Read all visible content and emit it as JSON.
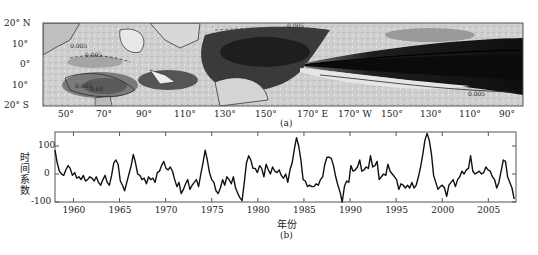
{
  "chart_data": [
    {
      "panel": "(a)",
      "type": "heatmap",
      "title": "",
      "description": "Spatial pattern map (EOF mode) over tropical Indian-Pacific Ocean, grayscale shaded with contours",
      "xlabel": "",
      "ylabel": "",
      "x_ticks": [
        "50°",
        "70°",
        "90°",
        "110°",
        "130°",
        "150°",
        "170° E",
        "170° W",
        "150°",
        "130°",
        "110°",
        "90°"
      ],
      "y_ticks": [
        "20° N",
        "10°",
        "0°",
        "10°",
        "20° S"
      ],
      "contour_labels": [
        "0.005",
        "0.005",
        "0.005",
        "0.005",
        "0.005",
        "0.01",
        "0.01",
        "0.005",
        "0.005"
      ],
      "xlim": [
        "40°E",
        "80°W"
      ],
      "ylim": [
        "20°S",
        "20°N"
      ],
      "caption": "(a)"
    },
    {
      "panel": "(b)",
      "type": "line",
      "title": "",
      "xlabel": "年份",
      "ylabel": "时间系数",
      "xlim": [
        1958,
        2008
      ],
      "ylim": [
        -100,
        150
      ],
      "x_ticks": [
        1960,
        1965,
        1970,
        1975,
        1980,
        1985,
        1990,
        1995,
        2000,
        2005
      ],
      "y_ticks": [
        -100,
        0,
        100
      ],
      "grid": false,
      "caption": "(b)",
      "series": [
        {
          "name": "time coefficient",
          "x": [
            1958.0,
            1958.3,
            1958.6,
            1958.9,
            1959.2,
            1959.5,
            1959.8,
            1960.1,
            1960.4,
            1960.7,
            1961.0,
            1961.3,
            1961.6,
            1961.9,
            1962.2,
            1962.5,
            1962.8,
            1963.1,
            1963.4,
            1963.7,
            1964.0,
            1964.3,
            1964.6,
            1964.9,
            1965.2,
            1965.5,
            1965.8,
            1966.1,
            1966.4,
            1966.7,
            1967.0,
            1967.3,
            1967.6,
            1967.9,
            1968.2,
            1968.5,
            1968.8,
            1969.1,
            1969.4,
            1969.7,
            1970.0,
            1970.3,
            1970.6,
            1970.9,
            1971.2,
            1971.5,
            1971.8,
            1972.1,
            1972.4,
            1972.7,
            1973.0,
            1973.3,
            1973.6,
            1973.9,
            1974.2,
            1974.5,
            1974.8,
            1975.1,
            1975.4,
            1975.7,
            1976.0,
            1976.3,
            1976.6,
            1976.9,
            1977.2,
            1977.5,
            1977.8,
            1978.1,
            1978.4,
            1978.7,
            1979.0,
            1979.3,
            1979.6,
            1979.9,
            1980.2,
            1980.5,
            1980.8,
            1981.1,
            1981.4,
            1981.7,
            1982.0,
            1982.3,
            1982.6,
            1982.9,
            1983.2,
            1983.5,
            1983.8,
            1984.1,
            1984.4,
            1984.7,
            1985.0,
            1985.3,
            1985.6,
            1985.9,
            1986.2,
            1986.5,
            1986.8,
            1987.1,
            1987.4,
            1987.7,
            1988.0,
            1988.3,
            1988.6,
            1988.9,
            1989.2,
            1989.5,
            1989.8,
            1990.1,
            1990.4,
            1990.7,
            1991.0,
            1991.3,
            1991.6,
            1991.9,
            1992.2,
            1992.5,
            1992.8,
            1993.1,
            1993.4,
            1993.7,
            1994.0,
            1994.3,
            1994.6,
            1994.9,
            1995.2,
            1995.5,
            1995.8,
            1996.1,
            1996.4,
            1996.7,
            1997.0,
            1997.3,
            1997.6,
            1997.9,
            1998.2,
            1998.5,
            1998.8,
            1999.1,
            1999.4,
            1999.7,
            2000.0,
            2000.3,
            2000.6,
            2000.9,
            2001.2,
            2001.5,
            2001.8,
            2002.1,
            2002.4,
            2002.7,
            2003.0,
            2003.3,
            2003.6,
            2003.9,
            2004.2,
            2004.5,
            2004.8,
            2005.1,
            2005.4,
            2005.7,
            2006.0,
            2006.3,
            2006.6,
            2006.9,
            2007.2,
            2007.5,
            2007.8
          ],
          "values": [
            85,
            40,
            10,
            0,
            -5,
            15,
            30,
            20,
            -5,
            5,
            -15,
            -10,
            -20,
            -5,
            -25,
            -20,
            -10,
            -15,
            -25,
            -10,
            -30,
            -40,
            -20,
            -5,
            -30,
            -40,
            -5,
            40,
            50,
            35,
            -25,
            -40,
            -60,
            -30,
            0,
            30,
            70,
            40,
            0,
            -5,
            -20,
            -15,
            -35,
            -10,
            -20,
            -15,
            -30,
            5,
            10,
            30,
            45,
            20,
            15,
            25,
            10,
            -20,
            -45,
            -30,
            -70,
            -55,
            -35,
            -20,
            -55,
            -40,
            -30,
            -20,
            -45,
            0,
            40,
            85,
            50,
            5,
            -20,
            -30,
            -60,
            -70,
            -50,
            -20,
            -40,
            -10,
            -20,
            -35,
            -10,
            -50,
            -70,
            -85,
            -95,
            -30,
            40,
            65,
            50,
            20,
            20,
            5,
            30,
            20,
            -10,
            35,
            15,
            0,
            25,
            10,
            5,
            15,
            -5,
            -15,
            0,
            -30,
            15,
            40,
            90,
            130,
            100,
            50,
            -20,
            -25,
            -45,
            -40,
            -45,
            -45,
            -35,
            -40,
            -20,
            -10,
            35,
            60,
            60,
            55,
            30,
            -10,
            -40,
            -65,
            -100,
            -45,
            -25,
            -30,
            30,
            10,
            15,
            25,
            50,
            10,
            15,
            25,
            20,
            65,
            25,
            30,
            45,
            -20,
            -10,
            0,
            -5,
            35,
            10,
            0,
            -10,
            -20,
            -55,
            -35,
            -40,
            -50,
            -40,
            -50,
            -30,
            -50,
            -40,
            -10,
            25,
            70,
            120,
            145,
            120,
            70,
            -5,
            -30,
            -55,
            -45,
            -40,
            -50,
            -80,
            -40,
            -30,
            -20,
            -45,
            -20,
            -10,
            10,
            0,
            15,
            20,
            65,
            10,
            0,
            5,
            10,
            0,
            5,
            25,
            15,
            10,
            -10,
            -20,
            -50,
            -30,
            10,
            50,
            45,
            -10,
            -30,
            -50,
            -90
          ]
        }
      ]
    }
  ],
  "labels": {
    "map_caption": "(a)",
    "ts_caption": "(b)",
    "ts_xlabel": "年份",
    "ts_ylabel": "时间系数"
  },
  "colors": {
    "line": "#111111",
    "frame": "#555555",
    "map_dark": "#2a2a2a",
    "map_mid": "#8a8a8a",
    "map_light": "#d8d8d8",
    "land": "#c8c8c8"
  }
}
